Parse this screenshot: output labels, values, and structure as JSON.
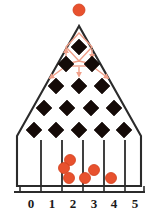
{
  "figure": {
    "kind": "galton-board",
    "colors": {
      "ball": "#e8512e",
      "ball_stroke": "#d13f1c",
      "peg": "#150b08",
      "outline": "#2b2b2b",
      "path": "#f0a08a",
      "axis": "#2b2b2b",
      "background": "#ffffff"
    }
  },
  "chart_data": {
    "type": "bar",
    "title": "",
    "xlabel": "",
    "ylabel": "",
    "categories": [
      "0",
      "1",
      "2",
      "3",
      "4",
      "5"
    ],
    "values": [
      0,
      0,
      3,
      2,
      1,
      0
    ],
    "grid": false,
    "legend": null
  },
  "input_ball": {
    "label": "input-ball",
    "cx": 79,
    "cy": 10,
    "r": 6
  },
  "funnel": {
    "apex_x": 79,
    "apex_y": 26,
    "left_x": 17,
    "right_x": 141,
    "shoulder_y": 136,
    "base_y": 186
  },
  "peg_rows": [
    {
      "row": 1,
      "count": 1,
      "y": 47,
      "cx": [
        79
      ]
    },
    {
      "row": 2,
      "count": 2,
      "y": 64,
      "cx": [
        66,
        92
      ]
    },
    {
      "row": 3,
      "count": 3,
      "y": 86,
      "cx": [
        56,
        79,
        102
      ]
    },
    {
      "row": 4,
      "count": 4,
      "y": 108,
      "cx": [
        44,
        67,
        91,
        114
      ]
    },
    {
      "row": 5,
      "count": 5,
      "y": 130,
      "cx": [
        34,
        56,
        79,
        102,
        124
      ]
    }
  ],
  "peg_size": 8,
  "paths": {
    "label": "ball-trajectory-paths",
    "arrow_count": 6,
    "top_entry_arrows": 2,
    "mid_arrows": 1,
    "bottom_arrows": 3
  },
  "bins": [
    {
      "index": 0,
      "label": "0",
      "center_x": 31,
      "balls": []
    },
    {
      "index": 1,
      "label": "1",
      "center_x": 52,
      "balls": []
    },
    {
      "index": 2,
      "label": "2",
      "center_x": 73,
      "balls": [
        {
          "cx": 70,
          "cy": 160
        },
        {
          "cx": 64,
          "cy": 168
        },
        {
          "cx": 69,
          "cy": 178
        }
      ]
    },
    {
      "index": 3,
      "label": "3",
      "center_x": 94,
      "balls": [
        {
          "cx": 94,
          "cy": 170
        },
        {
          "cx": 85,
          "cy": 178
        }
      ]
    },
    {
      "index": 4,
      "label": "4",
      "center_x": 114,
      "balls": [
        {
          "cx": 111,
          "cy": 178
        }
      ]
    },
    {
      "index": 5,
      "label": "5",
      "center_x": 135,
      "balls": []
    }
  ],
  "ball_radius": 5.5,
  "dividers": {
    "count": 5,
    "x": [
      41,
      62,
      83,
      104,
      125
    ],
    "top_y": 140,
    "bottom_y": 186
  },
  "axis": {
    "y": 192,
    "x_start": 14,
    "x_end": 145,
    "tick_height": 6,
    "ticks": [
      {
        "x": 20,
        "label": ""
      },
      {
        "x": 41,
        "label": ""
      },
      {
        "x": 62,
        "label": ""
      },
      {
        "x": 83,
        "label": ""
      },
      {
        "x": 104,
        "label": ""
      },
      {
        "x": 125,
        "label": ""
      },
      {
        "x": 144,
        "label": ""
      }
    ],
    "labels": [
      {
        "x": 31,
        "y": 208,
        "text": "0"
      },
      {
        "x": 52,
        "y": 208,
        "text": "1"
      },
      {
        "x": 73,
        "y": 208,
        "text": "2"
      },
      {
        "x": 94,
        "y": 208,
        "text": "3"
      },
      {
        "x": 114,
        "y": 208,
        "text": "4"
      },
      {
        "x": 135,
        "y": 208,
        "text": "5"
      }
    ]
  }
}
